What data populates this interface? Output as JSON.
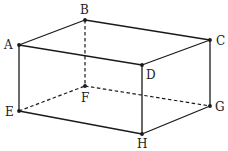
{
  "figure": {
    "vertices": [
      {
        "id": "A",
        "label": "A"
      },
      {
        "id": "B",
        "label": "B"
      },
      {
        "id": "C",
        "label": "C"
      },
      {
        "id": "D",
        "label": "D"
      },
      {
        "id": "E",
        "label": "E"
      },
      {
        "id": "F",
        "label": "F"
      },
      {
        "id": "G",
        "label": "G"
      },
      {
        "id": "H",
        "label": "H"
      }
    ],
    "visible_edges": [
      [
        "A",
        "B"
      ],
      [
        "B",
        "C"
      ],
      [
        "C",
        "D"
      ],
      [
        "D",
        "A"
      ],
      [
        "A",
        "E"
      ],
      [
        "D",
        "H"
      ],
      [
        "C",
        "G"
      ],
      [
        "E",
        "H"
      ],
      [
        "H",
        "G"
      ]
    ],
    "hidden_edges": [
      [
        "B",
        "F"
      ],
      [
        "E",
        "F"
      ],
      [
        "F",
        "G"
      ]
    ],
    "colors": {
      "line": "#1a1a1a",
      "label": "#222222",
      "background": "#ffffff"
    }
  }
}
